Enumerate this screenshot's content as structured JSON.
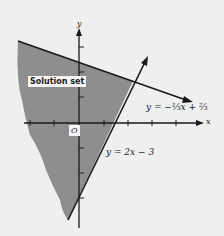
{
  "diagram": {
    "region_label": "Solution set",
    "y_axis_label": "y",
    "x_axis_label": "x",
    "origin_label": "O",
    "line1_label": "y = −⅓x + ⅔",
    "line2_label": "y = 2x − 3",
    "colors": {
      "shade": "#8e8e8e",
      "line": "#1a1a1a",
      "background": "#efefef"
    }
  }
}
